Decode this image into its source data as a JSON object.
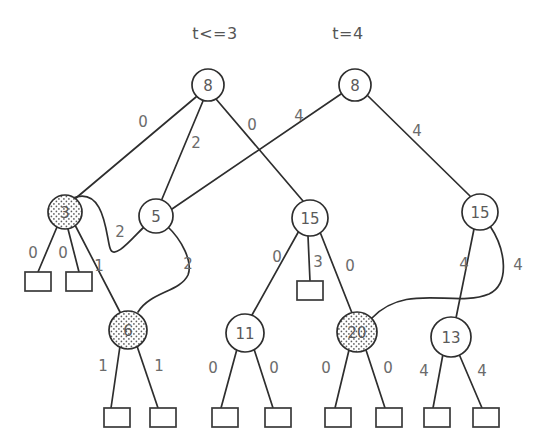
{
  "figure": {
    "type": "binary-decision-tree-diagram",
    "background_color": "#ffffff",
    "stroke_color": "#2e2e2e",
    "label_color": "#6b6b6b",
    "shaded_fill": "dotted-stipple"
  },
  "group_labels": [
    {
      "id": "group-left",
      "text": "t<=3",
      "x": 215,
      "y": 33
    },
    {
      "id": "group-right",
      "text": "t=4",
      "x": 348,
      "y": 33
    }
  ],
  "nodes": [
    {
      "id": "n-root-left",
      "label": "8",
      "x": 208,
      "y": 85,
      "r": 16,
      "shaded": false
    },
    {
      "id": "n-root-right",
      "label": "8",
      "x": 355,
      "y": 85,
      "r": 16,
      "shaded": false
    },
    {
      "id": "n-3",
      "label": "3",
      "x": 65,
      "y": 212,
      "r": 17,
      "shaded": true
    },
    {
      "id": "n-5",
      "label": "5",
      "x": 156,
      "y": 216,
      "r": 17,
      "shaded": false
    },
    {
      "id": "n-15-mid",
      "label": "15",
      "x": 310,
      "y": 218,
      "r": 18,
      "shaded": false
    },
    {
      "id": "n-15-right",
      "label": "15",
      "x": 480,
      "y": 212,
      "r": 18,
      "shaded": false
    },
    {
      "id": "n-6",
      "label": "6",
      "x": 128,
      "y": 330,
      "r": 19,
      "shaded": true
    },
    {
      "id": "n-11",
      "label": "11",
      "x": 245,
      "y": 333,
      "r": 19,
      "shaded": false
    },
    {
      "id": "n-20",
      "label": "20",
      "x": 357,
      "y": 332,
      "r": 20,
      "shaded": true
    },
    {
      "id": "n-13",
      "label": "13",
      "x": 451,
      "y": 337,
      "r": 20,
      "shaded": false
    }
  ],
  "leaves": [
    {
      "id": "leaf-3-a",
      "x": 25,
      "y": 272,
      "w": 26,
      "h": 19
    },
    {
      "id": "leaf-3-b",
      "x": 66,
      "y": 272,
      "w": 26,
      "h": 19
    },
    {
      "id": "leaf-15-b",
      "x": 297,
      "y": 281,
      "w": 26,
      "h": 19
    },
    {
      "id": "leaf-6-a",
      "x": 104,
      "y": 408,
      "w": 26,
      "h": 19
    },
    {
      "id": "leaf-6-b",
      "x": 150,
      "y": 408,
      "w": 26,
      "h": 19
    },
    {
      "id": "leaf-11-a",
      "x": 212,
      "y": 408,
      "w": 26,
      "h": 19
    },
    {
      "id": "leaf-11-b",
      "x": 265,
      "y": 408,
      "w": 26,
      "h": 19
    },
    {
      "id": "leaf-20-a",
      "x": 325,
      "y": 408,
      "w": 26,
      "h": 19
    },
    {
      "id": "leaf-20-b",
      "x": 376,
      "y": 408,
      "w": 26,
      "h": 19
    },
    {
      "id": "leaf-13-a",
      "x": 424,
      "y": 408,
      "w": 26,
      "h": 19
    },
    {
      "id": "leaf-13-b",
      "x": 473,
      "y": 408,
      "w": 26,
      "h": 19
    }
  ],
  "edges": [
    {
      "id": "e-rootL-3",
      "from": "n-root-left",
      "to": "n-3",
      "label": "0",
      "label_x": 143,
      "label_y": 122,
      "path": "M 196,97 L 76,198",
      "curved": false
    },
    {
      "id": "e-rootL-5",
      "from": "n-root-left",
      "to": "n-5",
      "label": "2",
      "label_x": 196,
      "label_y": 143,
      "path": "M 203,101 L 162,199",
      "curved": false
    },
    {
      "id": "e-rootL-15mid",
      "from": "n-root-left",
      "to": "n-15-mid",
      "label": "0",
      "label_x": 252,
      "label_y": 125,
      "path": "M 216,99 L 303,201",
      "curved": false
    },
    {
      "id": "e-rootR-5",
      "from": "n-root-right",
      "to": "n-5",
      "label": "4",
      "label_x": 299,
      "label_y": 116,
      "path": "M 341,94 L 172,209",
      "curved": false
    },
    {
      "id": "e-rootR-15r",
      "from": "n-root-right",
      "to": "n-15-right",
      "label": "4",
      "label_x": 417,
      "label_y": 131,
      "path": "M 368,96 L 470,196",
      "curved": false
    },
    {
      "id": "e-3-leafa",
      "from": "n-3",
      "to": "leaf-3-a",
      "label": "0",
      "label_x": 33,
      "label_y": 253,
      "path": "M 57,227 L 38,272",
      "curved": false
    },
    {
      "id": "e-3-leafb",
      "from": "n-3",
      "to": "leaf-3-b",
      "label": "0",
      "label_x": 63,
      "label_y": 253,
      "path": "M 68,229 L 79,272",
      "curved": false
    },
    {
      "id": "e-3-6",
      "from": "n-3",
      "to": "n-6",
      "label": "1",
      "label_x": 99,
      "label_y": 266,
      "path": "M 75,225 L 120,312",
      "curved": false
    },
    {
      "id": "e-3-5",
      "from": "n-3",
      "to": "n-5",
      "label": "2",
      "label_x": 120,
      "label_y": 232,
      "path": "M 73,198 C 105,186 106,236 110,248 C 114,262 134,236 146,225",
      "curved": true
    },
    {
      "id": "e-5-6",
      "from": "n-5",
      "to": "n-6",
      "label": "2",
      "label_x": 188,
      "label_y": 264,
      "path": "M 167,226 C 182,240 193,262 188,275 C 180,292 150,292 138,312",
      "curved": true
    },
    {
      "id": "e-15m-11",
      "from": "n-15-mid",
      "to": "n-11",
      "label": "0",
      "label_x": 277,
      "label_y": 257,
      "path": "M 300,229 L 252,315",
      "curved": false
    },
    {
      "id": "e-15m-leaf",
      "from": "n-15-mid",
      "to": "leaf-15-b",
      "label": "3",
      "label_x": 318,
      "label_y": 262,
      "path": "M 308,236 L 310,281",
      "curved": false
    },
    {
      "id": "e-15m-20",
      "from": "n-15-mid",
      "to": "n-20",
      "label": "0",
      "label_x": 350,
      "label_y": 266,
      "path": "M 320,232 L 352,313",
      "curved": false
    },
    {
      "id": "e-15r-13",
      "from": "n-15-right",
      "to": "n-13",
      "label": "4",
      "label_x": 464,
      "label_y": 264,
      "path": "M 474,229 L 456,318",
      "curved": false
    },
    {
      "id": "e-15r-20",
      "from": "n-15-right",
      "to": "n-20",
      "label": "4",
      "label_x": 518,
      "label_y": 265,
      "path": "M 490,226 C 506,250 510,284 489,294 C 455,308 406,282 372,318",
      "curved": true
    },
    {
      "id": "e-6-leafa",
      "from": "n-6",
      "to": "leaf-6-a",
      "label": "1",
      "label_x": 103,
      "label_y": 366,
      "path": "M 120,346 L 111,408",
      "curved": false
    },
    {
      "id": "e-6-leafb",
      "from": "n-6",
      "to": "leaf-6-b",
      "label": "1",
      "label_x": 159,
      "label_y": 366,
      "path": "M 137,346 L 158,408",
      "curved": false
    },
    {
      "id": "e-11-leafa",
      "from": "n-11",
      "to": "leaf-11-a",
      "label": "0",
      "label_x": 213,
      "label_y": 368,
      "path": "M 237,349 L 221,408",
      "curved": false
    },
    {
      "id": "e-11-leafb",
      "from": "n-11",
      "to": "leaf-11-b",
      "label": "0",
      "label_x": 274,
      "label_y": 368,
      "path": "M 254,349 L 273,408",
      "curved": false
    },
    {
      "id": "e-20-leafa",
      "from": "n-20",
      "to": "leaf-20-a",
      "label": "0",
      "label_x": 326,
      "label_y": 368,
      "path": "M 349,350 L 335,408",
      "curved": false
    },
    {
      "id": "e-20-leafb",
      "from": "n-20",
      "to": "leaf-20-b",
      "label": "0",
      "label_x": 388,
      "label_y": 368,
      "path": "M 366,350 L 385,408",
      "curved": false
    },
    {
      "id": "e-13-leafa",
      "from": "n-13",
      "to": "leaf-13-a",
      "label": "4",
      "label_x": 424,
      "label_y": 371,
      "path": "M 443,354 L 433,408",
      "curved": false
    },
    {
      "id": "e-13-leafb",
      "from": "n-13",
      "to": "leaf-13-b",
      "label": "4",
      "label_x": 482,
      "label_y": 371,
      "path": "M 459,354 L 482,408",
      "curved": false
    }
  ]
}
